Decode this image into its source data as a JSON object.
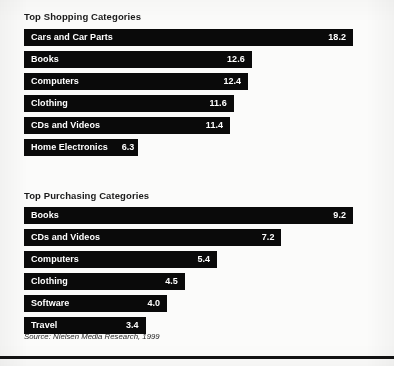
{
  "source_note": "Source: Nielsen Media Research, 1999",
  "colors": {
    "bar_fill": "#0a0a0a",
    "bar_text": "#ffffff",
    "page_background": "#fbfbfa",
    "title_text": "#1a1a1a",
    "rule": "#121212"
  },
  "chart_data": [
    {
      "type": "bar",
      "orientation": "horizontal",
      "title": "Top Shopping Categories",
      "xlabel": "",
      "ylabel": "",
      "grid": false,
      "legend": "none",
      "axis_visible": false,
      "value_labels": true,
      "xlim": [
        0,
        18.2
      ],
      "categories": [
        "Cars and Car Parts",
        "Books",
        "Computers",
        "Clothing",
        "CDs and Videos",
        "Home Electronics"
      ],
      "values": [
        18.2,
        12.6,
        12.4,
        11.6,
        11.4,
        6.3
      ],
      "value_text": [
        "18.2",
        "12.6",
        "12.4",
        "11.6",
        "11.4",
        "6.3"
      ]
    },
    {
      "type": "bar",
      "orientation": "horizontal",
      "title": "Top Purchasing Categories",
      "xlabel": "",
      "ylabel": "",
      "grid": false,
      "legend": "none",
      "axis_visible": false,
      "value_labels": true,
      "xlim": [
        0,
        9.2
      ],
      "categories": [
        "Books",
        "CDs and Videos",
        "Computers",
        "Clothing",
        "Software",
        "Travel"
      ],
      "values": [
        9.2,
        7.2,
        5.4,
        4.5,
        4.0,
        3.4
      ],
      "value_text": [
        "9.2",
        "7.2",
        "5.4",
        "4.5",
        "4.0",
        "3.4"
      ]
    }
  ]
}
